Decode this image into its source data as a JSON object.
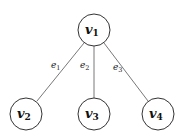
{
  "diagram": {
    "type": "tree",
    "nodes": [
      {
        "id": "v1",
        "base": "v",
        "sub": "1",
        "x": 94,
        "y": 30
      },
      {
        "id": "v2",
        "base": "v",
        "sub": "2",
        "x": 26,
        "y": 114
      },
      {
        "id": "v3",
        "base": "v",
        "sub": "3",
        "x": 94,
        "y": 114
      },
      {
        "id": "v4",
        "base": "v",
        "sub": "4",
        "x": 158,
        "y": 114
      }
    ],
    "edges": [
      {
        "id": "e1",
        "base": "e",
        "sub": "1",
        "from": "v1",
        "to": "v2"
      },
      {
        "id": "e2",
        "base": "e",
        "sub": "2",
        "from": "v1",
        "to": "v3"
      },
      {
        "id": "e3",
        "base": "e",
        "sub": "3",
        "from": "v1",
        "to": "v4"
      }
    ]
  }
}
